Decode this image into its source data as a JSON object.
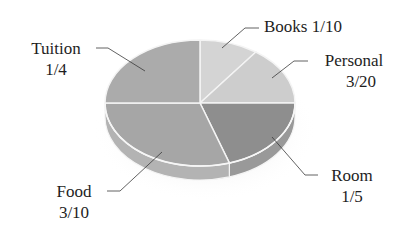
{
  "chart_data": {
    "type": "pie",
    "title": "",
    "style": "3d-tilted",
    "start_angle": "12 o'clock, clockwise",
    "slices": [
      {
        "name": "Books",
        "fraction_label": "1/10",
        "value": 0.1,
        "color": "#d4d4d4"
      },
      {
        "name": "Personal",
        "fraction_label": "3/20",
        "value": 0.15,
        "color": "#cdcdcd"
      },
      {
        "name": "Room",
        "fraction_label": "1/5",
        "value": 0.2,
        "color": "#8e8e8e"
      },
      {
        "name": "Food",
        "fraction_label": "3/10",
        "value": 0.3,
        "color": "#a6a6a6"
      },
      {
        "name": "Tuition",
        "fraction_label": "1/4",
        "value": 0.25,
        "color": "#ababab"
      }
    ],
    "legend": "none (leader-line labels)"
  },
  "labels": {
    "tuition": {
      "name": "Tuition",
      "value": "1/4"
    },
    "books": {
      "text": "Books 1/10"
    },
    "personal": {
      "name": "Personal",
      "value": "3/20"
    },
    "room": {
      "name": "Room",
      "value": "1/5"
    },
    "food": {
      "name": "Food",
      "value": "3/10"
    }
  }
}
